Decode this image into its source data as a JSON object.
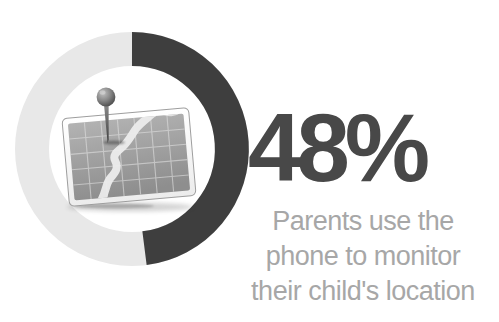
{
  "page": {
    "background": "#ffffff",
    "width": 499,
    "height": 322
  },
  "stat": {
    "value_label": "48%",
    "caption_lines": [
      "Parents use the",
      "phone to monitor",
      "their child's location"
    ],
    "value_color": "#484848",
    "caption_color": "#a7a7a7"
  },
  "chart_data": {
    "type": "pie",
    "subtype": "donut",
    "label": "48%",
    "caption": "Parents use the phone to monitor their child's location",
    "categories": [
      "parents-who-monitor",
      "remainder"
    ],
    "values": [
      48,
      52
    ],
    "colors": [
      "#3e3e3e",
      "#e8e8e8"
    ],
    "start_angle_deg": -90,
    "direction": "clockwise",
    "ring_outer_radius_px": 117,
    "ring_thickness_px": 34,
    "center_icon": "map-with-pushpin"
  }
}
